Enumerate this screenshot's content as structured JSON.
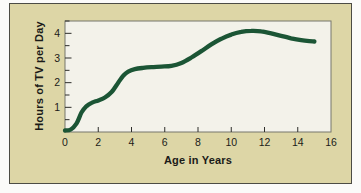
{
  "figure": {
    "page_bg": "#fbfbf9",
    "panel_bg": "#ddd6a6",
    "panel_border": "#4c4c44",
    "plot_bg": "#f3f2ea",
    "plot_border": "#77776d",
    "axis_color": "#2e2e2a",
    "text_color": "#1b1b18",
    "curve_color": "#1b5535"
  },
  "chart_data": {
    "type": "line",
    "title": "",
    "xlabel": "Age in Years",
    "ylabel": "Hours of TV per Day",
    "xlim": [
      0,
      16
    ],
    "ylim": [
      0,
      4.5
    ],
    "x_tick_labels": [
      "0",
      "2",
      "4",
      "6",
      "8",
      "10",
      "12",
      "14",
      "16"
    ],
    "x_tick_values": [
      0,
      2,
      4,
      6,
      8,
      10,
      12,
      14,
      16
    ],
    "y_tick_labels": [
      "1",
      "2",
      "3",
      "4"
    ],
    "y_tick_values": [
      1,
      2,
      3,
      4
    ],
    "y_minor_tick_values": [
      0.5,
      1.5,
      2.5,
      3.5,
      4.5
    ],
    "grid": false,
    "legend_position": "none",
    "series": [
      {
        "name": "hours_of_tv_per_day",
        "points": [
          [
            0,
            0.06
          ],
          [
            0.35,
            0.1
          ],
          [
            0.7,
            0.35
          ],
          [
            1,
            0.8
          ],
          [
            1.3,
            1.05
          ],
          [
            1.6,
            1.18
          ],
          [
            2,
            1.28
          ],
          [
            2.4,
            1.4
          ],
          [
            2.8,
            1.62
          ],
          [
            3.2,
            2.0
          ],
          [
            3.5,
            2.28
          ],
          [
            3.8,
            2.45
          ],
          [
            4.2,
            2.55
          ],
          [
            4.7,
            2.6
          ],
          [
            5.2,
            2.63
          ],
          [
            5.8,
            2.65
          ],
          [
            6.4,
            2.68
          ],
          [
            7,
            2.8
          ],
          [
            7.6,
            3.02
          ],
          [
            8.2,
            3.28
          ],
          [
            8.8,
            3.55
          ],
          [
            9.4,
            3.78
          ],
          [
            10,
            3.95
          ],
          [
            10.6,
            4.06
          ],
          [
            11.2,
            4.1
          ],
          [
            11.8,
            4.08
          ],
          [
            12.4,
            4.0
          ],
          [
            13,
            3.9
          ],
          [
            13.6,
            3.8
          ],
          [
            14.2,
            3.72
          ],
          [
            14.7,
            3.68
          ],
          [
            15,
            3.67
          ]
        ]
      }
    ]
  }
}
